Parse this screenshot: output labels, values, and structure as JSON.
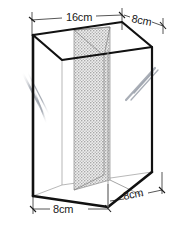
{
  "figure": {
    "kind": "geometry-diagram",
    "background_color": "#ffffff",
    "outline_color": "#111111",
    "hidden_edge_color": "#8a8a8a",
    "panel_fill_color": "#d8d8d8",
    "glare_color": "#b8bcc4"
  },
  "dimensions": {
    "top_left": {
      "label": "16cm",
      "value": 16,
      "unit": "cm",
      "edge": "top front-left width"
    },
    "top_right": {
      "label": "8cm",
      "value": 8,
      "unit": "cm",
      "edge": "top depth (receding)"
    },
    "bottom_left": {
      "label": "8cm",
      "value": 8,
      "unit": "cm",
      "edge": "base front-left segment"
    },
    "bottom_right": {
      "label": "8cm",
      "value": 8,
      "unit": "cm",
      "edge": "base front-right segment"
    }
  },
  "labels": [
    {
      "id": "dim-16cm-top",
      "text": "16cm"
    },
    {
      "id": "dim-8cm-top-right",
      "text": "8cm"
    },
    {
      "id": "dim-8cm-bottom-left",
      "text": "8cm"
    },
    {
      "id": "dim-8cm-bottom-right",
      "text": "8cm"
    }
  ],
  "parts": {
    "box_name": "outer-box",
    "partition_name": "shaded-partition-panel",
    "glare_left_name": "glass-glare-left",
    "glare_right_name": "glass-glare-right"
  }
}
